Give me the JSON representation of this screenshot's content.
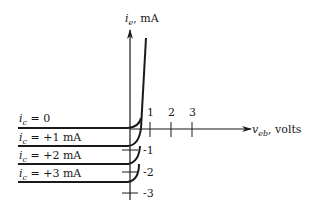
{
  "figure": {
    "y_axis": {
      "var": "i",
      "sub": "e",
      "unit": ", mA"
    },
    "x_axis": {
      "var": "v",
      "sub": "eb",
      "unit": ", volts"
    },
    "x_ticks": [
      "1",
      "2",
      "3"
    ],
    "y_ticks": [
      "-1",
      "-2",
      "-3"
    ],
    "curves": [
      {
        "var": "i",
        "sub": "c",
        "rest": " = 0"
      },
      {
        "var": "i",
        "sub": "c",
        "rest": " = +1 mA"
      },
      {
        "var": "i",
        "sub": "c",
        "rest": " = +2 mA"
      },
      {
        "var": "i",
        "sub": "c",
        "rest": " = +3 mA"
      }
    ]
  }
}
